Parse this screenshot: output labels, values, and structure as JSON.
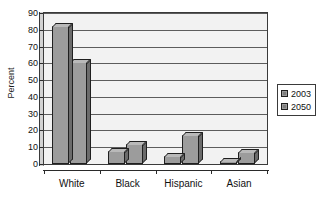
{
  "chart_data": {
    "type": "bar",
    "title": "",
    "subtitle": "",
    "xlabel": "",
    "ylabel": "Percent",
    "ylim": [
      0,
      90
    ],
    "ytick_step": 10,
    "yticks": [
      90,
      80,
      70,
      60,
      50,
      40,
      30,
      20,
      10,
      0
    ],
    "grid": true,
    "legend_position": "right",
    "categories": [
      "White",
      "Black",
      "Hispanic",
      "Asian"
    ],
    "series": [
      {
        "name": "2003",
        "values": [
          82,
          8,
          5,
          2
        ],
        "color": "#9c9c9c"
      },
      {
        "name": "2050",
        "values": [
          61,
          12,
          17,
          7
        ],
        "color": "#9c9c9c"
      }
    ]
  },
  "legend": {
    "items": [
      {
        "label": "2003",
        "swatch": "legend-swatch-2003"
      },
      {
        "label": "2050",
        "swatch": "legend-swatch-2050"
      }
    ]
  },
  "axes": {
    "y_title": "Percent"
  },
  "colors": {
    "plot_background": "#f2f2f2",
    "gridline": "#5c5c5c",
    "bar_face": "#9c9c9c",
    "bar_top": "#b9b9b9",
    "bar_side": "#6b6b6b",
    "bar_outline": "#1f1f1f",
    "axis": "#2a2a2a",
    "text": "#111111"
  }
}
